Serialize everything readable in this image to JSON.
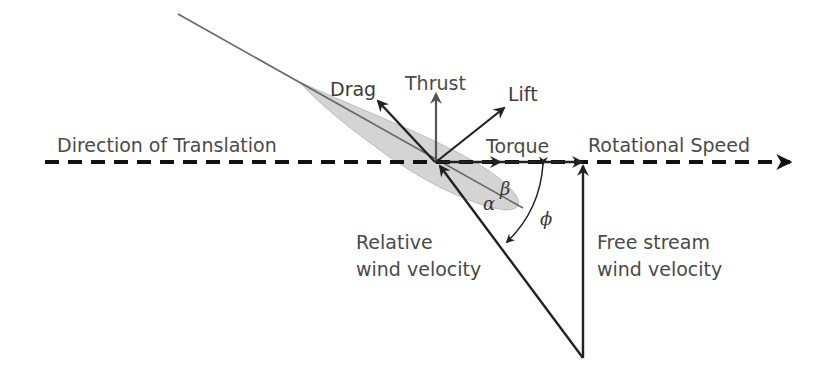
{
  "diagram": {
    "labels": {
      "direction_of_translation": "Direction of Translation",
      "rotational_speed": "Rotational Speed",
      "drag": "Drag",
      "thrust": "Thrust",
      "lift": "Lift",
      "torque": "Torque",
      "relative_wind_line1": "Relative",
      "relative_wind_line2": "wind velocity",
      "free_stream_line1": "Free stream",
      "free_stream_line2": "wind velocity",
      "alpha": "α",
      "beta": "β",
      "phi": "ϕ"
    },
    "colors": {
      "arrow": "#222222",
      "thrust_arrow": "#555555",
      "chord_line": "#666666",
      "blade_fill": "#cfcfcf",
      "text": "#4a4a4a"
    }
  }
}
